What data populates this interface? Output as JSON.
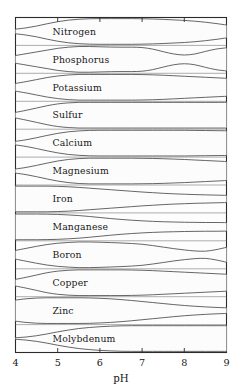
{
  "figure": {
    "title_visible": false,
    "background_color": "#ffffff",
    "plot_background_color": "#fdfdfd",
    "frame_color": "#2b2b2b",
    "band_outline_color": "#4a4a4a",
    "band_fill_color": "#fcfcfc"
  },
  "axis": {
    "title": "pH",
    "tick_labels": [
      "4",
      "5",
      "6",
      "7",
      "8",
      "9"
    ],
    "tick_values": [
      4,
      5,
      6,
      7,
      8,
      9
    ],
    "range": [
      4,
      9
    ],
    "top_ticks": [
      5,
      6,
      7,
      8
    ],
    "bottom_ticks": [
      5,
      6,
      7,
      8
    ]
  },
  "chart_data": {
    "type": "area",
    "xlabel": "pH",
    "ylabel": "",
    "xlim": [
      4,
      9
    ],
    "grid": false,
    "legend": "none",
    "note": "Each horizontal band is a nutrient; band thickness at a given pH encodes relative availability of that nutrient (0 = unavailable, 1 = fully available).",
    "x": [
      4.0,
      4.25,
      4.5,
      4.75,
      5.0,
      5.25,
      5.5,
      5.75,
      6.0,
      6.25,
      6.5,
      6.75,
      7.0,
      7.25,
      7.5,
      7.75,
      8.0,
      8.25,
      8.5,
      8.75,
      9.0
    ],
    "series": [
      {
        "name": "Nitrogen",
        "label": "Nitrogen",
        "values": [
          0.18,
          0.28,
          0.42,
          0.6,
          0.76,
          0.88,
          0.95,
          0.99,
          1.0,
          1.0,
          1.0,
          1.0,
          0.99,
          0.97,
          0.94,
          0.9,
          0.86,
          0.8,
          0.72,
          0.62,
          0.5
        ]
      },
      {
        "name": "Phosphorus",
        "label": "Phosphorus",
        "values": [
          0.3,
          0.44,
          0.58,
          0.72,
          0.86,
          0.95,
          1.0,
          1.0,
          0.98,
          0.96,
          0.95,
          0.95,
          0.92,
          0.8,
          0.6,
          0.42,
          0.34,
          0.42,
          0.62,
          0.8,
          0.9
        ]
      },
      {
        "name": "Potassium",
        "label": "Potassium",
        "values": [
          0.3,
          0.44,
          0.6,
          0.76,
          0.88,
          0.96,
          1.0,
          1.0,
          1.0,
          1.0,
          1.0,
          1.0,
          0.99,
          0.97,
          0.94,
          0.9,
          0.86,
          0.82,
          0.78,
          0.74,
          0.7
        ]
      },
      {
        "name": "Sulfur",
        "label": "Sulfur",
        "values": [
          0.22,
          0.38,
          0.56,
          0.74,
          0.88,
          0.96,
          1.0,
          1.0,
          1.0,
          1.0,
          1.0,
          1.0,
          1.0,
          1.0,
          1.0,
          1.0,
          1.0,
          1.0,
          1.0,
          1.0,
          1.0
        ]
      },
      {
        "name": "Calcium",
        "label": "Calcium",
        "values": [
          0.14,
          0.26,
          0.42,
          0.6,
          0.76,
          0.88,
          0.95,
          0.99,
          1.0,
          1.0,
          1.0,
          1.0,
          1.0,
          1.0,
          1.0,
          1.0,
          1.0,
          0.99,
          0.98,
          0.97,
          0.96
        ]
      },
      {
        "name": "Magnesium",
        "label": "Magnesium",
        "values": [
          0.16,
          0.28,
          0.44,
          0.62,
          0.78,
          0.9,
          0.97,
          1.0,
          1.0,
          1.0,
          1.0,
          1.0,
          0.99,
          0.98,
          0.96,
          0.93,
          0.9,
          0.86,
          0.82,
          0.78,
          0.74
        ]
      },
      {
        "name": "Iron",
        "label": "Iron",
        "values": [
          1.0,
          1.0,
          1.0,
          1.0,
          0.98,
          0.95,
          0.9,
          0.84,
          0.78,
          0.72,
          0.66,
          0.6,
          0.54,
          0.49,
          0.44,
          0.4,
          0.37,
          0.34,
          0.32,
          0.3,
          0.28
        ]
      },
      {
        "name": "Manganese",
        "label": "Manganese",
        "values": [
          1.0,
          1.0,
          1.0,
          0.99,
          0.97,
          0.93,
          0.88,
          0.81,
          0.73,
          0.65,
          0.58,
          0.52,
          0.47,
          0.43,
          0.4,
          0.38,
          0.36,
          0.35,
          0.34,
          0.34,
          0.33
        ]
      },
      {
        "name": "Boron",
        "label": "Boron",
        "values": [
          0.34,
          0.5,
          0.66,
          0.8,
          0.9,
          0.96,
          1.0,
          1.0,
          0.98,
          0.95,
          0.92,
          0.88,
          0.82,
          0.72,
          0.6,
          0.48,
          0.38,
          0.3,
          0.28,
          0.4,
          0.58
        ]
      },
      {
        "name": "Copper",
        "label": "Copper",
        "values": [
          0.26,
          0.42,
          0.6,
          0.78,
          0.9,
          0.97,
          1.0,
          1.0,
          1.0,
          1.0,
          1.0,
          0.99,
          0.97,
          0.94,
          0.9,
          0.86,
          0.82,
          0.78,
          0.74,
          0.7,
          0.66
        ]
      },
      {
        "name": "Zinc",
        "label": "Zinc",
        "values": [
          0.82,
          0.92,
          0.98,
          1.0,
          1.0,
          1.0,
          1.0,
          0.99,
          0.96,
          0.92,
          0.86,
          0.79,
          0.71,
          0.63,
          0.55,
          0.47,
          0.4,
          0.34,
          0.29,
          0.25,
          0.22
        ]
      },
      {
        "name": "Molybdenum",
        "label": "Molybdenum",
        "values": [
          0.06,
          0.12,
          0.22,
          0.36,
          0.52,
          0.66,
          0.78,
          0.86,
          0.92,
          0.96,
          0.99,
          1.0,
          1.0,
          1.0,
          1.0,
          1.0,
          1.0,
          1.0,
          1.0,
          1.0,
          1.0
        ]
      }
    ]
  }
}
